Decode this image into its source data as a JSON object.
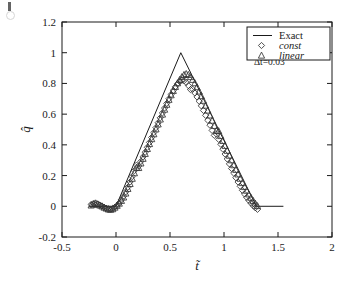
{
  "figure": {
    "background_color": "#ffffff",
    "ink_color": "#1a1a1a",
    "marker_edge_color": "#333333",
    "scan_artifact": "scan-mark"
  },
  "chart_data": {
    "type": "line",
    "title": "",
    "xlabel": "t̃",
    "ylabel": "q̂",
    "xlim": [
      -0.5,
      2
    ],
    "ylim": [
      -0.2,
      1.2
    ],
    "xticks": [
      -0.5,
      0,
      0.5,
      1,
      1.5,
      2
    ],
    "xticklabels": [
      "-0.5",
      "0",
      "0.5",
      "1",
      "1.5",
      "2"
    ],
    "yticks": [
      -0.2,
      0,
      0.2,
      0.4,
      0.6,
      0.8,
      1,
      1.2
    ],
    "yticklabels": [
      "-0.2",
      "0",
      "0.2",
      "0.4",
      "0.6",
      "0.8",
      "1",
      "1.2"
    ],
    "grid": false,
    "tick_direction": "in",
    "legend_position": "upper right",
    "annotations": [
      {
        "text": "Δt̃=0.03",
        "x": 1.42,
        "y": 0.92
      }
    ],
    "series": [
      {
        "name": "Exact",
        "label": "Exact",
        "style": "line",
        "marker": "none",
        "linestyle": "solid",
        "x": [
          -0.25,
          -0.05,
          0.0,
          0.6,
          1.3,
          1.55
        ],
        "y": [
          0.0,
          0.0,
          0.0,
          1.0,
          0.0,
          0.0
        ]
      },
      {
        "name": "const",
        "label": "const",
        "style": "markers",
        "marker": "diamond",
        "linestyle": "none",
        "x": [
          -0.23,
          -0.21,
          -0.19,
          -0.17,
          -0.15,
          -0.13,
          -0.11,
          -0.09,
          -0.07,
          -0.05,
          -0.03,
          -0.01,
          0.01,
          0.03,
          0.05,
          0.07,
          0.09,
          0.11,
          0.13,
          0.15,
          0.17,
          0.19,
          0.21,
          0.23,
          0.25,
          0.27,
          0.29,
          0.31,
          0.33,
          0.35,
          0.37,
          0.39,
          0.41,
          0.43,
          0.45,
          0.47,
          0.49,
          0.51,
          0.53,
          0.55,
          0.57,
          0.59,
          0.61,
          0.63,
          0.65,
          0.67,
          0.69,
          0.71,
          0.73,
          0.75,
          0.77,
          0.79,
          0.81,
          0.83,
          0.85,
          0.87,
          0.89,
          0.91,
          0.93,
          0.95,
          0.97,
          0.99,
          1.01,
          1.03,
          1.05,
          1.07,
          1.09,
          1.11,
          1.13,
          1.15,
          1.17,
          1.19,
          1.21,
          1.23,
          1.25,
          1.27,
          1.29,
          1.31
        ],
        "y": [
          0.012,
          0.018,
          0.022,
          0.016,
          0.008,
          0.002,
          -0.006,
          -0.012,
          -0.016,
          -0.018,
          -0.014,
          -0.006,
          0.006,
          0.022,
          0.042,
          0.066,
          0.094,
          0.124,
          0.158,
          0.194,
          0.232,
          0.268,
          0.262,
          0.292,
          0.322,
          0.352,
          0.384,
          0.416,
          0.448,
          0.48,
          0.512,
          0.544,
          0.576,
          0.608,
          0.64,
          0.67,
          0.7,
          0.728,
          0.754,
          0.778,
          0.798,
          0.812,
          0.82,
          0.818,
          0.806,
          0.786,
          0.76,
          0.762,
          0.738,
          0.712,
          0.684,
          0.654,
          0.624,
          0.592,
          0.56,
          0.528,
          0.494,
          0.462,
          0.47,
          0.436,
          0.404,
          0.372,
          0.34,
          0.308,
          0.276,
          0.246,
          0.216,
          0.186,
          0.158,
          0.13,
          0.104,
          0.08,
          0.058,
          0.038,
          0.02,
          0.004,
          -0.01,
          -0.02
        ]
      },
      {
        "name": "linear",
        "label": "linear",
        "style": "markers",
        "marker": "triangle",
        "linestyle": "none",
        "x": [
          -0.23,
          -0.21,
          -0.19,
          -0.17,
          -0.15,
          -0.13,
          -0.11,
          -0.09,
          -0.07,
          -0.05,
          -0.03,
          -0.01,
          0.01,
          0.03,
          0.05,
          0.07,
          0.09,
          0.11,
          0.13,
          0.15,
          0.17,
          0.19,
          0.21,
          0.23,
          0.25,
          0.27,
          0.29,
          0.31,
          0.33,
          0.35,
          0.37,
          0.39,
          0.41,
          0.43,
          0.45,
          0.47,
          0.49,
          0.51,
          0.53,
          0.55,
          0.57,
          0.59,
          0.61,
          0.63,
          0.65,
          0.67,
          0.69,
          0.71,
          0.73,
          0.75,
          0.77,
          0.79,
          0.81,
          0.83,
          0.85,
          0.87,
          0.89,
          0.91,
          0.93,
          0.95,
          0.97,
          0.99,
          1.01,
          1.03,
          1.05,
          1.07,
          1.09,
          1.11,
          1.13,
          1.15,
          1.17,
          1.19,
          1.21,
          1.23,
          1.25,
          1.27,
          1.29,
          1.31
        ],
        "y": [
          0.006,
          0.012,
          0.016,
          0.012,
          0.006,
          0.0,
          -0.008,
          -0.014,
          -0.02,
          -0.022,
          -0.018,
          -0.008,
          0.004,
          0.018,
          0.036,
          0.058,
          0.084,
          0.114,
          0.146,
          0.18,
          0.216,
          0.252,
          0.25,
          0.28,
          0.31,
          0.342,
          0.374,
          0.406,
          0.438,
          0.47,
          0.502,
          0.534,
          0.566,
          0.598,
          0.63,
          0.662,
          0.694,
          0.724,
          0.752,
          0.778,
          0.802,
          0.824,
          0.842,
          0.856,
          0.862,
          0.856,
          0.842,
          0.824,
          0.802,
          0.776,
          0.748,
          0.718,
          0.688,
          0.656,
          0.624,
          0.592,
          0.558,
          0.524,
          0.492,
          0.49,
          0.458,
          0.426,
          0.394,
          0.362,
          0.33,
          0.3,
          0.268,
          0.238,
          0.208,
          0.18,
          0.152,
          0.126,
          0.102,
          0.078,
          0.056,
          0.036,
          0.018,
          0.002
        ]
      }
    ]
  }
}
